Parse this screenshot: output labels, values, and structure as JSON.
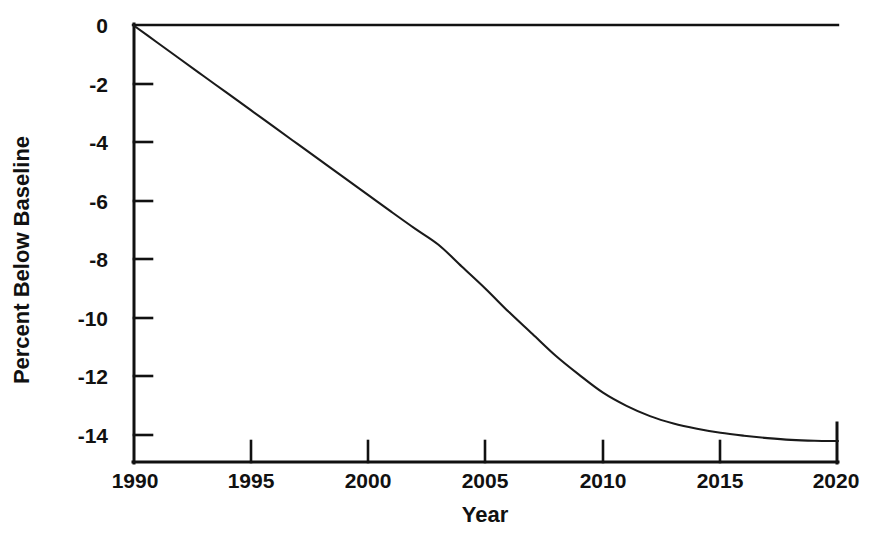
{
  "figure": {
    "background_color": "#ffffff",
    "line_color": "#1a1a1a",
    "axis_color": "#111111"
  },
  "chart_data": {
    "type": "line",
    "title": "",
    "subtitle": "",
    "xlabel": "Year",
    "ylabel": "Percent Below Baseline",
    "xlim": [
      1990,
      2020
    ],
    "ylim": [
      -14.95,
      0.0
    ],
    "grid": false,
    "legend": null,
    "xticks": [
      1990,
      1995,
      2000,
      2005,
      2010,
      2015,
      2020
    ],
    "xtick_labels": [
      "1990",
      "1995",
      "2000",
      "2005",
      "2010",
      "2015",
      "2020"
    ],
    "yticks": [
      0,
      -2,
      -4,
      -6,
      -8,
      -10,
      -12,
      -14
    ],
    "ytick_labels": [
      "0",
      "-2",
      "-4",
      "-6",
      "-8",
      "-10",
      "-12",
      "-14"
    ],
    "series": [
      {
        "name": "Percent Below Baseline",
        "x": [
          1990,
          1991,
          1992,
          1993,
          1994,
          1995,
          1996,
          1997,
          1998,
          1999,
          2000,
          2001,
          2002,
          2003,
          2004,
          2005,
          2006,
          2007,
          2008,
          2009,
          2010,
          2011,
          2012,
          2013,
          2014,
          2015,
          2016,
          2017,
          2018,
          2019,
          2020
        ],
        "values": [
          0.0,
          -0.58,
          -1.16,
          -1.74,
          -2.32,
          -2.9,
          -3.48,
          -4.06,
          -4.64,
          -5.22,
          -5.8,
          -6.38,
          -6.95,
          -7.5,
          -8.25,
          -9.0,
          -9.8,
          -10.55,
          -11.3,
          -11.95,
          -12.55,
          -13.0,
          -13.35,
          -13.6,
          -13.78,
          -13.92,
          -14.02,
          -14.1,
          -14.16,
          -14.19,
          -14.2
        ]
      }
    ]
  },
  "geometry": {
    "plot_left_px": 133,
    "plot_right_px": 838,
    "plot_top_px": 25,
    "plot_bottom_px": 463
  }
}
